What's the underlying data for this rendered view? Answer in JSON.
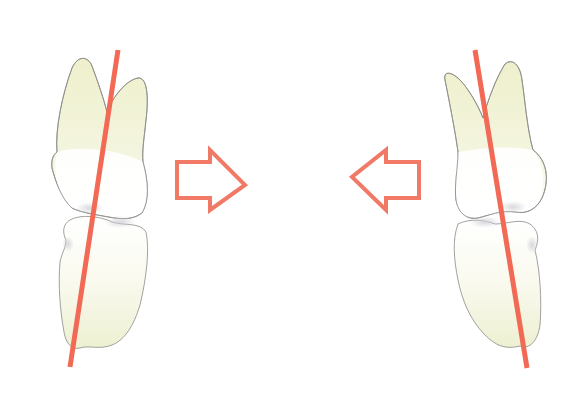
{
  "figure": {
    "colors": {
      "background": "#ffffff",
      "axis_line": "#f26a55",
      "arrow_stroke": "#f07a66",
      "tooth_outline": "#8a8a86",
      "tooth_root_fill": "#f1f2d6",
      "tooth_crown_fill": "#ffffff",
      "tooth_body_fill": "#f6f6e6"
    },
    "left_pair": {
      "axis": {
        "x1": 118,
        "y1": 50,
        "x2": 70,
        "y2": 367
      },
      "arrow": {
        "direction": "right",
        "icon": "arrow-right-outline-icon"
      }
    },
    "right_pair": {
      "axis": {
        "x1": 475,
        "y1": 50,
        "x2": 527,
        "y2": 368
      },
      "arrow": {
        "direction": "left",
        "icon": "arrow-left-outline-icon"
      }
    }
  }
}
